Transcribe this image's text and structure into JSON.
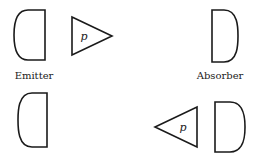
{
  "diagram": {
    "top_row": {
      "emitter": {
        "label": "Emitter"
      },
      "particle": {
        "label": "p",
        "direction": "right"
      },
      "absorber": {
        "label": "Absorber"
      }
    },
    "bottom_row": {
      "emitter": {
        "label": ""
      },
      "particle": {
        "label": "p",
        "direction": "left"
      },
      "absorber": {
        "label": ""
      }
    }
  },
  "colors": {
    "stroke": "#1a1a1a",
    "background": "#ffffff"
  }
}
